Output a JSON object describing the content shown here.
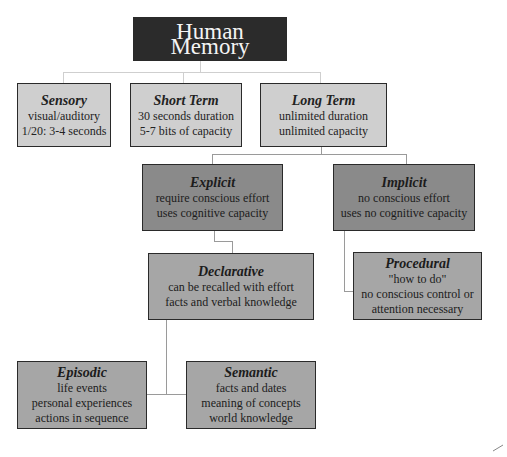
{
  "diagram": {
    "title": "Human Memory",
    "level1": [
      {
        "id": "sensory",
        "heading": "Sensory",
        "lines": [
          "visual/auditory",
          "1/20: 3-4 seconds"
        ]
      },
      {
        "id": "short-term",
        "heading": "Short Term",
        "lines": [
          "30 seconds duration",
          "5-7 bits of capacity"
        ]
      },
      {
        "id": "long-term",
        "heading": "Long Term",
        "lines": [
          "unlimited duration",
          "unlimited capacity"
        ]
      }
    ],
    "level2": [
      {
        "id": "explicit",
        "heading": "Explicit",
        "lines": [
          "require conscious effort",
          "uses cognitive capacity"
        ]
      },
      {
        "id": "implicit",
        "heading": "Implicit",
        "lines": [
          "no conscious effort",
          "uses no cognitive capacity"
        ]
      }
    ],
    "level3": [
      {
        "id": "declarative",
        "heading": "Declarative",
        "lines": [
          "can be recalled with effort",
          "facts and verbal knowledge"
        ]
      },
      {
        "id": "procedural",
        "heading": "Procedural",
        "lines": [
          "\"how to do\"",
          "no conscious control or",
          "attention necessary"
        ]
      }
    ],
    "level4": [
      {
        "id": "episodic",
        "heading": "Episodic",
        "lines": [
          "life events",
          "personal experiences",
          "actions in sequence"
        ]
      },
      {
        "id": "semantic",
        "heading": "Semantic",
        "lines": [
          "facts and dates",
          "meaning of concepts",
          "world knowledge"
        ]
      }
    ],
    "colors": {
      "title_bg": "#2b2b2b",
      "light_box": "#cfcfcf",
      "dark_box": "#8a8a8a",
      "mid_box": "#a6a6a6",
      "connector": "#9a9a9a"
    }
  }
}
